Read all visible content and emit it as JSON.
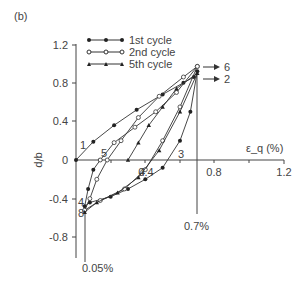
{
  "panel_label": "(b)",
  "chart_data": {
    "type": "line",
    "title": "",
    "xlabel": "ε_q (%)",
    "ylabel": "q/p",
    "xlim": [
      0,
      1.2
    ],
    "ylim": [
      -0.9,
      1.2
    ],
    "x_ticks": [
      "0.4",
      "0.8",
      "1.2"
    ],
    "y_ticks": [
      "1.2",
      "0.8",
      "0.4",
      "0",
      "-0.4",
      "-0.8"
    ],
    "grid": false,
    "legend_position": "upper-left",
    "series": [
      {
        "name": "1st cycle",
        "marker": "filled-circle",
        "x": [
          0,
          0.1,
          0.22,
          0.35,
          0.5,
          0.62,
          0.68,
          0.7,
          0.66,
          0.6,
          0.5,
          0.4,
          0.3,
          0.2,
          0.08,
          0.05,
          0.07,
          0.1,
          0.14
        ],
        "y": [
          0,
          0.19,
          0.36,
          0.52,
          0.68,
          0.8,
          0.86,
          0.92,
          0.5,
          0.2,
          -0.08,
          -0.2,
          -0.3,
          -0.38,
          -0.44,
          -0.48,
          -0.3,
          -0.1,
          0
        ]
      },
      {
        "name": "2nd cycle",
        "marker": "open-circle",
        "x": [
          0.14,
          0.22,
          0.34,
          0.46,
          0.58,
          0.7,
          0.6,
          0.5,
          0.4,
          0.28,
          0.14,
          0.05,
          0.08,
          0.12,
          0.18,
          0.26,
          0.36,
          0.48,
          0.62,
          0.7
        ],
        "y": [
          0,
          0.18,
          0.34,
          0.5,
          0.7,
          0.97,
          0.55,
          0.2,
          -0.1,
          -0.3,
          -0.42,
          -0.52,
          -0.4,
          -0.2,
          0,
          0.2,
          0.44,
          0.66,
          0.86,
          0.97
        ]
      },
      {
        "name": "5th cycle",
        "marker": "filled-triangle",
        "x": [
          0.3,
          0.36,
          0.42,
          0.5,
          0.58,
          0.7,
          0.6,
          0.48,
          0.36,
          0.24,
          0.12,
          0.05
        ],
        "y": [
          0,
          0.18,
          0.36,
          0.55,
          0.74,
          0.9,
          0.5,
          0.1,
          -0.18,
          -0.34,
          -0.44,
          -0.54
        ]
      }
    ],
    "annotations": [
      {
        "text": "1",
        "x": 0.03,
        "y": 0.13
      },
      {
        "text": "2",
        "x": 0.8,
        "y": 0.9
      },
      {
        "text": "3",
        "x": 0.58,
        "y": 0.03
      },
      {
        "text": "4",
        "x": 0.38,
        "y": -0.08
      },
      {
        "text": "4",
        "x": 0.0,
        "y": -0.45
      },
      {
        "text": "5",
        "x": 0.11,
        "y": 0.04
      },
      {
        "text": "6",
        "x": 0.8,
        "y": 0.97
      },
      {
        "text": "8",
        "x": 0.0,
        "y": -0.55
      },
      {
        "text": "0.7%",
        "x": 0.7,
        "y": -0.75
      },
      {
        "text": "0.05%",
        "x": 0.05,
        "y": -0.95
      }
    ],
    "reference_lines": [
      {
        "type": "vertical",
        "x": 0.7,
        "label": "0.7%"
      },
      {
        "type": "vertical",
        "x": 0.05,
        "label": "0.05%"
      }
    ]
  }
}
